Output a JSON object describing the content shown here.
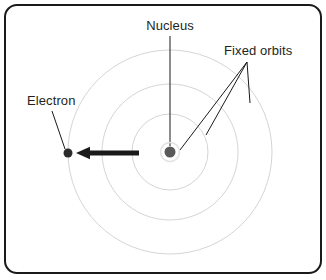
{
  "figure": {
    "type": "labelled-diagram",
    "width": 326,
    "height": 280,
    "background_color": "#ffffff"
  },
  "frame": {
    "name": "panel-border",
    "stroke_color": "#1a1a1a",
    "stroke_width": 2,
    "corner_radius": 12,
    "x": 5,
    "y": 5,
    "width": 316,
    "height": 268
  },
  "atom": {
    "center_x": 170,
    "center_y": 152,
    "nucleus": {
      "label": "Nucleus",
      "fill_color": "#595959",
      "radius": 5.5,
      "halo_color": "#e2e2e2",
      "halo_radius": 9.5
    },
    "electron": {
      "label": "Electron",
      "fill_color": "#2b2b2b",
      "radius": 4.5,
      "x": 68,
      "y": 153
    },
    "orbits": {
      "label": "Fixed orbits",
      "stroke_color": "#d5d5d5",
      "stroke_width": 1,
      "radii": [
        38,
        68,
        102
      ],
      "count": 3
    },
    "motion_arrow": {
      "name": "electron-direction-arrow",
      "color": "#1a1a1a",
      "stroke_width": 5,
      "from_x": 139,
      "from_y": 153,
      "to_x": 76,
      "to_y": 153,
      "direction": "left"
    }
  },
  "labels": {
    "nucleus": {
      "text": "Nucleus",
      "x": 170,
      "y": 30,
      "anchor": "middle"
    },
    "fixed_orbits": {
      "text": "Fixed orbits",
      "x": 224,
      "y": 55,
      "anchor": "start"
    },
    "electron": {
      "text": "Electron",
      "x": 27,
      "y": 105,
      "anchor": "start"
    }
  },
  "leader_lines": {
    "color": "#1a1a1a",
    "stroke_width": 1,
    "nucleus": {
      "x1": 170,
      "y1": 36,
      "x2": 170,
      "y2": 146
    },
    "electron": {
      "x1": 52,
      "y1": 111,
      "x2": 65,
      "y2": 149
    },
    "fixed_orbits_hub_x": 247,
    "fixed_orbits_hub_y": 62,
    "fixed_orbits_targets": [
      {
        "x": 180,
        "y": 150,
        "note": "inner-orbit"
      },
      {
        "x": 206,
        "y": 135,
        "note": "middle-orbit"
      },
      {
        "x": 250,
        "y": 103,
        "note": "outer-orbit"
      }
    ]
  }
}
